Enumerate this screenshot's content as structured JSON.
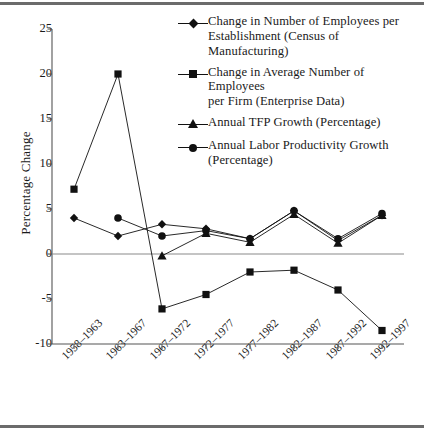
{
  "chart_data": {
    "type": "line",
    "title": "",
    "xlabel": "",
    "ylabel": "Percentage Change",
    "ylim": [
      -10,
      25
    ],
    "yticks": [
      25,
      20,
      15,
      10,
      5,
      0,
      -5,
      -10
    ],
    "ytick_labels": [
      "25",
      "20",
      "15",
      "10",
      "5",
      "0",
      "-5",
      "-10"
    ],
    "grid": false,
    "legend_position": "top-right",
    "zero_line": true,
    "categories": [
      "1958–1963",
      "1963–1967",
      "1967–1972",
      "1972–1977",
      "1977–1982",
      "1982–1987",
      "1987–1992",
      "1992–1997"
    ],
    "series": [
      {
        "name": "Change in Number of Employees per Establishment (Census of Manufacturing)",
        "marker": "diamond",
        "values": [
          4.0,
          2.0,
          3.3,
          2.8,
          1.7,
          4.8,
          1.5,
          4.3
        ]
      },
      {
        "name": "Change in  Average Number of  Employees per Firm (Enterprise Data)",
        "marker": "square",
        "values": [
          7.2,
          20.0,
          -6.1,
          -4.5,
          -2.0,
          -1.8,
          -4.0,
          -8.5
        ]
      },
      {
        "name": "Annual TFP Growth (Percentage)",
        "marker": "triangle",
        "values": [
          null,
          null,
          -0.2,
          2.3,
          1.3,
          4.4,
          1.2,
          4.3
        ]
      },
      {
        "name": "Annual Labor Productivity Growth (Percentage)",
        "marker": "circle",
        "values": [
          null,
          4.0,
          2.0,
          2.6,
          1.7,
          4.8,
          1.7,
          4.5
        ]
      }
    ]
  },
  "axis": {
    "y_title": "Percentage Change"
  },
  "legend": {
    "entries": [
      {
        "marker": "diamond",
        "line1": "Change in Number of Employees per",
        "line2": "Establishment (Census of Manufacturing)"
      },
      {
        "marker": "square",
        "line1": "Change in  Average Number of  Employees",
        "line2": "per Firm (Enterprise Data)"
      },
      {
        "marker": "triangle",
        "line1": "Annual TFP Growth (Percentage)",
        "line2": ""
      },
      {
        "marker": "circle",
        "line1": "Annual Labor Productivity Growth",
        "line2": "(Percentage)"
      }
    ]
  },
  "colors": {
    "ink": "#111111",
    "rule": "#6b6b6b",
    "axis": "#555555",
    "background": "#ffffff"
  }
}
